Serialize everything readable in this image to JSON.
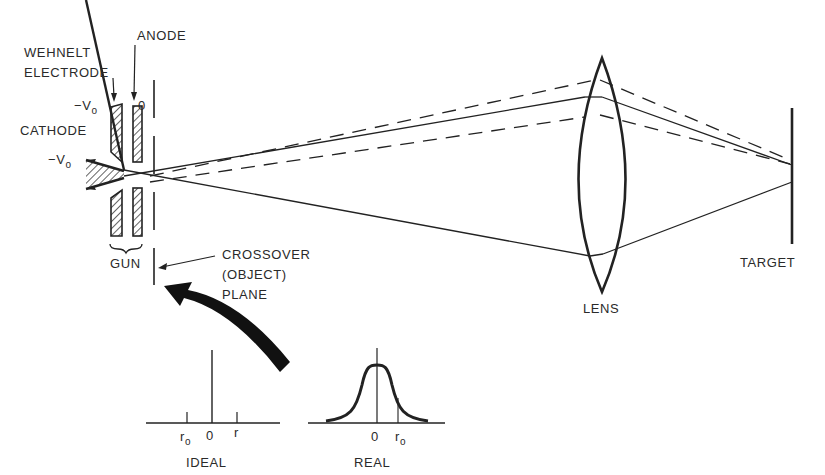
{
  "labels": {
    "anode": "ANODE",
    "wehnelt_line1": "WEHNELT",
    "wehnelt_line2": "ELECTRODE",
    "cathode": "CATHODE",
    "gun": "GUN",
    "crossover_line1": "CROSSOVER",
    "crossover_line2": "(OBJECT)",
    "crossover_line3": "PLANE",
    "lens": "LENS",
    "target": "TARGET"
  },
  "potentials": {
    "wehnelt_minus": "−V",
    "wehnelt_sub": "o",
    "cathode_minus": "−V",
    "cathode_sub": "o",
    "anode_value": "0"
  },
  "insets": {
    "ideal": {
      "title": "IDEAL",
      "tick_left_main": "r",
      "tick_left_sub": "o",
      "tick_center": "0",
      "tick_right": "r"
    },
    "real": {
      "title": "REAL",
      "tick_center": "0",
      "tick_right_main": "r",
      "tick_right_sub": "o"
    }
  },
  "colors": {
    "ink": "#222222",
    "text": "#2a2a2a",
    "background": "#ffffff"
  }
}
